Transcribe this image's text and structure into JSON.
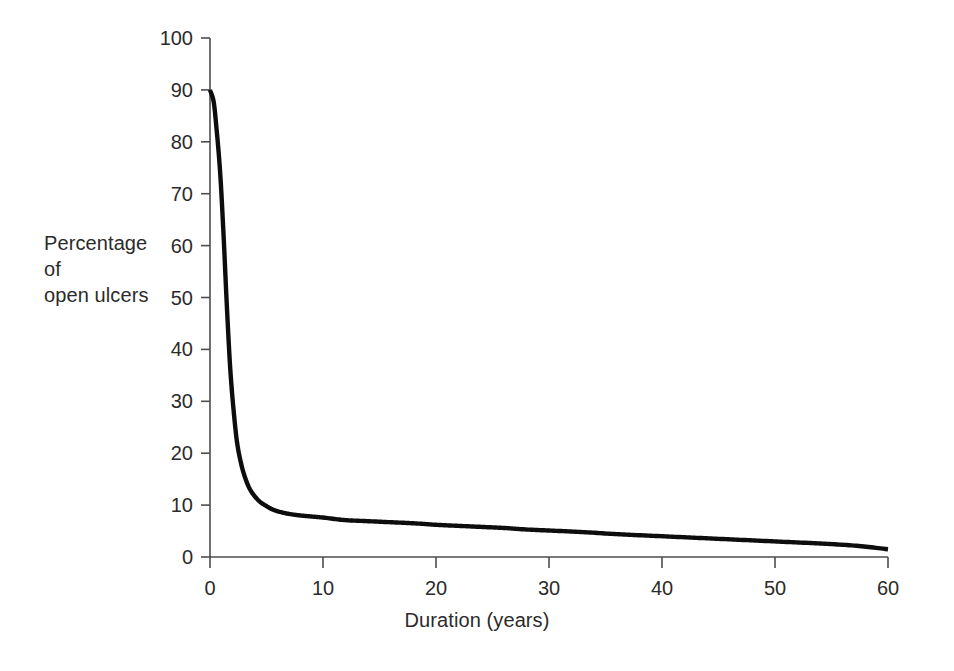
{
  "chart_data": {
    "type": "line",
    "title": "",
    "xlabel": "Duration (years)",
    "ylabel": "Percentage\nof\nopen ulcers",
    "ylabel_lines": [
      "Percentage",
      "of",
      "open ulcers"
    ],
    "xlim": [
      0,
      60
    ],
    "ylim": [
      0,
      100
    ],
    "xticks": [
      0,
      10,
      20,
      30,
      40,
      50,
      60
    ],
    "yticks": [
      0,
      10,
      20,
      30,
      40,
      50,
      60,
      70,
      80,
      90,
      100
    ],
    "xtick_labels": [
      "0",
      "10",
      "20",
      "30",
      "40",
      "50",
      "60"
    ],
    "ytick_labels": [
      "0",
      "10",
      "20",
      "30",
      "40",
      "50",
      "60",
      "70",
      "80",
      "90",
      "100"
    ],
    "grid": false,
    "legend": null,
    "legend_position": "none",
    "series": [
      {
        "name": "Percentage of open ulcers",
        "color": "#0d0d0d",
        "line_width": 4.4,
        "x": [
          0,
          0.3,
          0.6,
          0.9,
          1.2,
          1.5,
          1.8,
          2.1,
          2.4,
          2.7,
          3.0,
          3.5,
          4.0,
          4.5,
          5.0,
          5.5,
          6.0,
          7.0,
          8.0,
          9.0,
          10.0,
          12.0,
          14.0,
          16.0,
          18.0,
          20.0,
          22.0,
          24.0,
          26.0,
          28.0,
          30.0,
          33.0,
          36.0,
          39.0,
          42.0,
          45.0,
          48.0,
          51.0,
          54.0,
          57.0,
          60.0
        ],
        "y": [
          90,
          88,
          82,
          74,
          62,
          48,
          36,
          28,
          22,
          18.5,
          16,
          13.2,
          11.6,
          10.5,
          9.8,
          9.2,
          8.8,
          8.3,
          8.0,
          7.8,
          7.6,
          7.1,
          6.9,
          6.7,
          6.5,
          6.2,
          6.0,
          5.8,
          5.6,
          5.3,
          5.1,
          4.8,
          4.4,
          4.1,
          3.8,
          3.5,
          3.2,
          2.9,
          2.6,
          2.2,
          1.5
        ]
      }
    ],
    "annotations": []
  },
  "axis_title_y": "Percentage\nof\nopen ulcers",
  "axis_title_x": "Duration (years)",
  "colors": {
    "background": "#ffffff",
    "curve": "#0d0d0d",
    "axis": "#4d4d4d",
    "text": "#2b2b2b"
  }
}
